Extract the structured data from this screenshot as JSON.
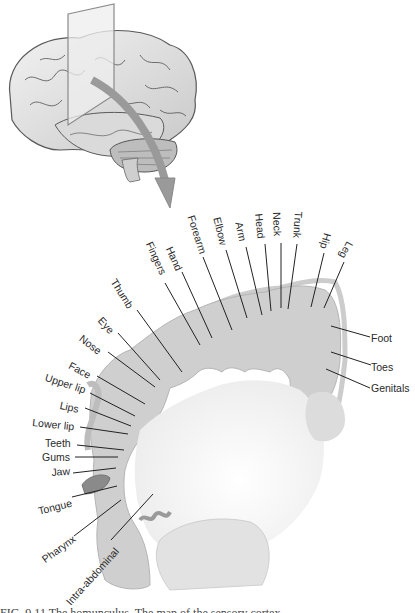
{
  "figure": {
    "illustration": "brain-with-coronal-slice-and-arrow",
    "section": "sensory-homunculus-cortex-slice",
    "colors": {
      "brain_stroke": "#5a5a5a",
      "brain_fill": "#e4e4e4",
      "cortex_fill": "#cfcfcf",
      "white_matter": "#f4f4f4",
      "arrow": "#9a9a9a",
      "label_line": "#222222"
    }
  },
  "labels": {
    "top": [
      {
        "text": "Fingers"
      },
      {
        "text": "Hand"
      },
      {
        "text": "Forearm"
      },
      {
        "text": "Elbow"
      },
      {
        "text": "Arm"
      },
      {
        "text": "Head"
      },
      {
        "text": "Neck"
      },
      {
        "text": "Trunk"
      },
      {
        "text": "Hip"
      },
      {
        "text": "Leg"
      }
    ],
    "left": [
      {
        "text": "Thumb"
      },
      {
        "text": "Eye"
      },
      {
        "text": "Nose"
      },
      {
        "text": "Face"
      },
      {
        "text": "Upper lip"
      },
      {
        "text": "Lips"
      },
      {
        "text": "Lower lip"
      },
      {
        "text": "Teeth"
      },
      {
        "text": "Gums"
      },
      {
        "text": "Jaw"
      },
      {
        "text": "Tongue"
      },
      {
        "text": "Pharynx"
      },
      {
        "text": "Intra-abdominal"
      }
    ],
    "right": [
      {
        "text": "Foot"
      },
      {
        "text": "Toes"
      },
      {
        "text": "Genitals"
      }
    ]
  },
  "caption": "FIG. 9.11 The homunculus. The map of the sensory cortex..."
}
